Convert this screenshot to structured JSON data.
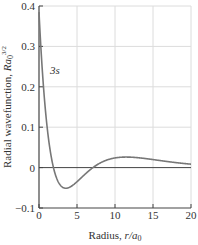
{
  "chart_data": {
    "type": "line",
    "title": "",
    "xlabel": "Radius, r/a0",
    "ylabel": "Radial wavefunction, Ra0^3/2",
    "xlim": [
      0,
      20
    ],
    "ylim": [
      -0.1,
      0.4
    ],
    "x_ticks": [
      "0",
      "5",
      "10",
      "15",
      "20"
    ],
    "y_ticks": [
      "-0.1",
      "0",
      "0.1",
      "0.2",
      "0.3",
      "0.4"
    ],
    "grid": true,
    "series": [
      {
        "name": "3s",
        "x": [
          0,
          0.5,
          1,
          1.5,
          1.9,
          2.5,
          3,
          3.5,
          4,
          5,
          6,
          7.1,
          8,
          9,
          10,
          11,
          12,
          14,
          16,
          18,
          20
        ],
        "values": [
          0.385,
          0.26,
          0.16,
          0.08,
          0.0,
          -0.035,
          -0.047,
          -0.052,
          -0.051,
          -0.042,
          -0.024,
          0.0,
          0.01,
          0.019,
          0.023,
          0.024,
          0.023,
          0.019,
          0.015,
          0.011,
          0.008
        ]
      }
    ],
    "annotations": [
      {
        "text": "3s",
        "x": 1.2,
        "y": 0.26
      }
    ]
  },
  "labels": {
    "xlabel_main": "Radius, ",
    "xlabel_var": "r/a",
    "xlabel_sub": "0",
    "ylabel_main": "Radial wavefunction, ",
    "ylabel_var": "Ra",
    "ylabel_sub": "0",
    "ylabel_sup": "3/2",
    "curve_label": "3s"
  }
}
